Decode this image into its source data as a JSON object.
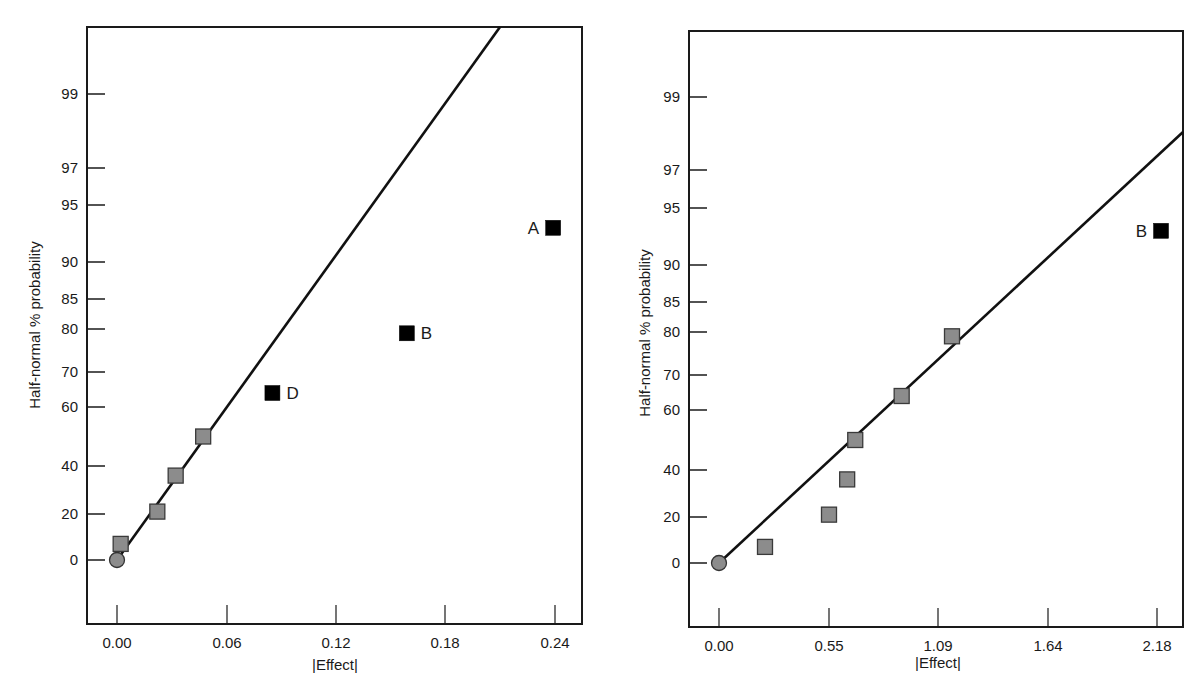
{
  "chart_data": [
    {
      "type": "scatter",
      "title": "",
      "xlabel": "|Effect|",
      "ylabel": "Half-normal % probability",
      "x_ticks": [
        "0.00",
        "0.06",
        "0.12",
        "0.18",
        "0.24"
      ],
      "x_tick_values": [
        0.0,
        0.06,
        0.12,
        0.18,
        0.24
      ],
      "y_ticks": [
        "0",
        "20",
        "40",
        "60",
        "70",
        "80",
        "85",
        "90",
        "95",
        "97",
        "99"
      ],
      "y_tick_values": [
        0,
        20,
        40,
        60,
        70,
        80,
        85,
        90,
        95,
        97,
        99
      ],
      "xlim": [
        -0.016,
        0.254
      ],
      "grid": false,
      "legend": null,
      "series": [
        {
          "name": "origin",
          "marker": "circle",
          "color": "#8c8c8c",
          "points": [
            {
              "x": 0.0,
              "y": 0
            }
          ]
        },
        {
          "name": "error effects",
          "marker": "square",
          "color": "#8c8c8c",
          "points": [
            {
              "x": 0.002,
              "y": 7
            },
            {
              "x": 0.022,
              "y": 21
            },
            {
              "x": 0.032,
              "y": 36
            },
            {
              "x": 0.047,
              "y": 50
            }
          ]
        },
        {
          "name": "significant effects",
          "marker": "square",
          "color": "#000000",
          "points": [
            {
              "x": 0.085,
              "y": 64,
              "label": "D",
              "label_side": "right"
            },
            {
              "x": 0.159,
              "y": 79,
              "label": "B",
              "label_side": "right"
            },
            {
              "x": 0.239,
              "y": 93,
              "label": "A",
              "label_side": "left"
            }
          ]
        }
      ],
      "fit_line": {
        "from": {
          "x": 0.0,
          "y": 0
        },
        "to_px": {
          "x": 500,
          "y": 27
        }
      }
    },
    {
      "type": "scatter",
      "title": "",
      "xlabel": "|Effect|",
      "ylabel": "Half-normal % probability",
      "x_ticks": [
        "0.00",
        "0.55",
        "1.09",
        "1.64",
        "2.18"
      ],
      "x_tick_values": [
        0.0,
        0.55,
        1.09,
        1.64,
        2.18
      ],
      "y_ticks": [
        "0",
        "20",
        "40",
        "60",
        "70",
        "80",
        "85",
        "90",
        "95",
        "97",
        "99"
      ],
      "y_tick_values": [
        0,
        20,
        40,
        60,
        70,
        80,
        85,
        90,
        95,
        97,
        99
      ],
      "xlim": [
        -0.15,
        2.31
      ],
      "grid": false,
      "legend": null,
      "series": [
        {
          "name": "origin",
          "marker": "circle",
          "color": "#8c8c8c",
          "points": [
            {
              "x": 0.0,
              "y": 0
            }
          ]
        },
        {
          "name": "error effects",
          "marker": "square",
          "color": "#8c8c8c",
          "points": [
            {
              "x": 0.23,
              "y": 7
            },
            {
              "x": 0.55,
              "y": 21
            },
            {
              "x": 0.64,
              "y": 36
            },
            {
              "x": 0.68,
              "y": 50
            },
            {
              "x": 0.91,
              "y": 64
            },
            {
              "x": 1.16,
              "y": 79
            }
          ]
        },
        {
          "name": "significant effects",
          "marker": "square",
          "color": "#000000",
          "points": [
            {
              "x": 2.2,
              "y": 93,
              "label": "B",
              "label_side": "left"
            }
          ]
        }
      ],
      "fit_line": {
        "from": {
          "x": 0.0,
          "y": 0
        },
        "to_px": {
          "x": 1183,
          "y": 132
        }
      }
    }
  ],
  "layout": [
    {
      "frame": {
        "left": 87,
        "top": 27,
        "right": 582,
        "bottom": 624
      },
      "x_px": [
        117,
        227,
        336,
        445,
        555
      ],
      "y_px": [
        560,
        514,
        466,
        407,
        372,
        329,
        299,
        262,
        205,
        168,
        94
      ],
      "xlabel_pos": {
        "x": 335,
        "y": 670
      },
      "ylabel_pos": {
        "x": 40,
        "y": 325
      }
    },
    {
      "frame": {
        "left": 689,
        "top": 31,
        "right": 1183,
        "bottom": 627
      },
      "x_px": [
        719,
        829,
        938,
        1048,
        1157
      ],
      "y_px": [
        563,
        517,
        470,
        410,
        375,
        332,
        302,
        265,
        208,
        170,
        97
      ],
      "xlabel_pos": {
        "x": 938,
        "y": 668
      },
      "ylabel_pos": {
        "x": 650,
        "y": 333
      }
    }
  ]
}
